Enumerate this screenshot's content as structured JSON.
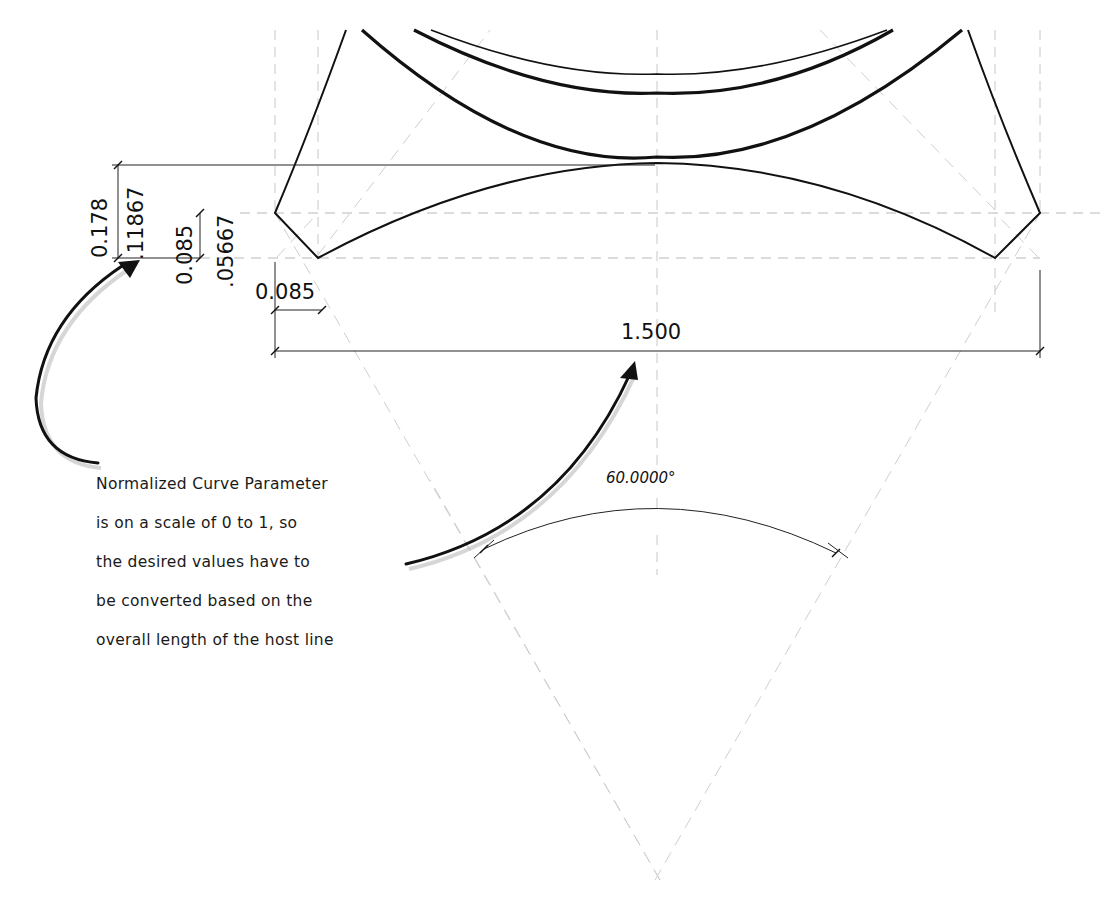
{
  "drawing": {
    "dimensions": {
      "overall_height": "0.178",
      "arc_height": ".11867",
      "chamfer_height": "0.085",
      "chamfer_offset": ".05667",
      "chamfer_width": "0.085",
      "overall_width": "1.500",
      "angle": "60.0000°"
    },
    "note": {
      "lines": [
        "Normalized Curve Parameter",
        "is on a scale of 0 to 1, so",
        "the desired values have to",
        "be converted based on the",
        "overall length of the host line"
      ]
    },
    "colors": {
      "geometry": "#111111",
      "reference_lines": "#c8c8c8",
      "background": "#ffffff"
    }
  }
}
